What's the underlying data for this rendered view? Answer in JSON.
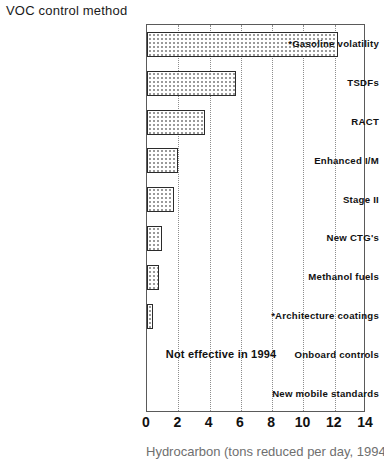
{
  "chart_data": {
    "type": "bar",
    "orientation": "horizontal",
    "title": "VOC control method",
    "xlabel": "Hydrocarbon (tons reduced per day, 1994)",
    "ylabel": "VOC control method",
    "xlim": [
      0,
      14
    ],
    "ylim": null,
    "grid": true,
    "legend": null,
    "xticks": [
      0,
      2,
      4,
      6,
      8,
      10,
      12,
      14
    ],
    "xtick_labels": [
      "0",
      "2",
      "4",
      "6",
      "8",
      "10",
      "12",
      "14"
    ],
    "categories": [
      "*Gasoline volatility",
      "TSDFs",
      "RACT",
      "Enhanced I/M",
      "Stage II",
      "New CTG's",
      "Methanol fuels",
      "*Architecture coatings",
      "Onboard controls",
      "New mobile standards"
    ],
    "values": [
      12.2,
      5.7,
      3.7,
      1.95,
      1.7,
      0.95,
      0.75,
      0.4,
      0,
      0
    ],
    "annotations": [
      {
        "text": "Not effective in 1994",
        "x": 1.2,
        "category": "Onboard controls"
      }
    ],
    "footnote_marker": "*",
    "bar_fill": "dotted-pattern",
    "bar_edge_color": "#2b2b2b",
    "bar_fill_color": "#ffffff",
    "gridline_color": "#8d8d8d",
    "frame_color": "#5a5a5a"
  },
  "title": {
    "text": "VOC control method"
  },
  "axis": {
    "x_title": "Hydrocarbon (tons reduced per day, 1994)"
  }
}
